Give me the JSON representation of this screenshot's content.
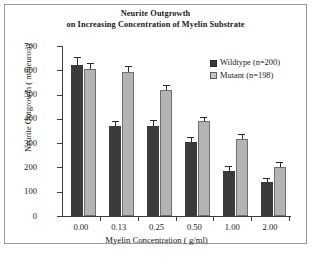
{
  "chart_data": {
    "type": "bar",
    "title": "Neurite Outgrowth on Increasing Concentration of Myelin Substrate",
    "title_line1": "Neurite Outgrowth",
    "title_line2": "on Increasing Concentration of Myelin Substrate",
    "xlabel": "Myelin Concentration ( g/ml)",
    "ylabel": "Neurite Outgrowth ( m/neuron)",
    "categories": [
      "0.00",
      "0.13",
      "0.25",
      "0.50",
      "1.00",
      "2.00"
    ],
    "ylim": [
      0,
      700
    ],
    "yticks": [
      "0",
      "100",
      "200",
      "300",
      "400",
      "500",
      "600",
      "700"
    ],
    "grid": false,
    "legend_position": "top-right",
    "series": [
      {
        "name": "Wildtype (n=200)",
        "color": "#3b3b3b",
        "values": [
          620,
          370,
          372,
          305,
          185,
          140
        ],
        "errors": [
          30,
          18,
          20,
          15,
          18,
          13
        ]
      },
      {
        "name": "Mutant (n=198)",
        "color": "#b4b4b4",
        "values": [
          605,
          595,
          517,
          390,
          317,
          200
        ],
        "errors": [
          20,
          20,
          20,
          14,
          18,
          18
        ]
      }
    ]
  },
  "legend": {
    "items": [
      {
        "label": "Wildtype (n=200)"
      },
      {
        "label": "Mutant (n=198)"
      }
    ]
  }
}
